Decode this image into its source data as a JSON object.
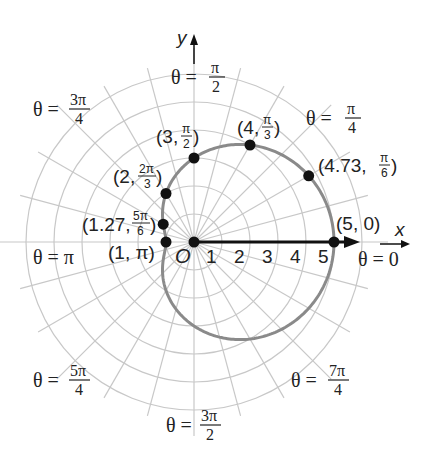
{
  "chart_data": {
    "type": "line",
    "title": "",
    "plot_kind": "polar",
    "equation": "r = 3 + 2cos(theta)",
    "pole": {
      "x": 194,
      "y": 242,
      "label": "O"
    },
    "scale_px_per_unit": 28,
    "grid": {
      "on": true,
      "rings": [
        1,
        2,
        3,
        4,
        5,
        6
      ],
      "spoke_step_deg": 15,
      "color": "#c8c8c8"
    },
    "axes": {
      "x_label": "x",
      "y_label": "y",
      "tick_labels": [
        "1",
        "2",
        "3",
        "4",
        "5"
      ]
    },
    "curve": {
      "color": "#8a8a8a",
      "width": 3
    },
    "points": [
      {
        "r": 5,
        "theta_deg": 0,
        "label": "(5, 0)"
      },
      {
        "r": 4.73,
        "theta_deg": 30,
        "label_prefix": "(4.73, ",
        "label_frac_num": "π",
        "label_frac_den": "6"
      },
      {
        "r": 4,
        "theta_deg": 60,
        "label_prefix": "(4, ",
        "label_frac_num": "π",
        "label_frac_den": "3"
      },
      {
        "r": 3,
        "theta_deg": 90,
        "label_prefix": "(3, ",
        "label_frac_num": "π",
        "label_frac_den": "2"
      },
      {
        "r": 2,
        "theta_deg": 120,
        "label_prefix": "(2, ",
        "label_frac_num": "2π",
        "label_frac_den": "3"
      },
      {
        "r": 1.27,
        "theta_deg": 150,
        "label_prefix": "(1.27, ",
        "label_frac_num": "5π",
        "label_frac_den": "6"
      },
      {
        "r": 1,
        "theta_deg": 180,
        "label": "(1, π)"
      }
    ],
    "angle_labels": [
      {
        "text": "θ = 0",
        "theta_deg": 0
      },
      {
        "text_prefix": "θ = ",
        "num": "π",
        "den": "4",
        "theta_deg": 45
      },
      {
        "text_prefix": "θ = ",
        "num": "π",
        "den": "2",
        "theta_deg": 90
      },
      {
        "text_prefix": "θ = ",
        "num": "3π",
        "den": "4",
        "theta_deg": 135
      },
      {
        "text": "θ = π",
        "theta_deg": 180
      },
      {
        "text_prefix": "θ = ",
        "num": "5π",
        "den": "4",
        "theta_deg": 225
      },
      {
        "text_prefix": "θ = ",
        "num": "3π",
        "den": "2",
        "theta_deg": 270
      },
      {
        "text_prefix": "θ = ",
        "num": "7π",
        "den": "4",
        "theta_deg": 315
      }
    ]
  },
  "labels": {
    "x_axis": "x",
    "y_axis": "y",
    "origin": "O",
    "ticks": [
      "1",
      "2",
      "3",
      "4",
      "5"
    ],
    "theta_0": "θ = 0",
    "theta_pi": "θ = π",
    "theta_prefix": "θ = ",
    "frac": {
      "pi_4": {
        "num": "π",
        "den": "4"
      },
      "pi_2": {
        "num": "π",
        "den": "2"
      },
      "3pi_4": {
        "num": "3π",
        "den": "4"
      },
      "5pi_4": {
        "num": "5π",
        "den": "4"
      },
      "3pi_2": {
        "num": "3π",
        "den": "2"
      },
      "7pi_4": {
        "num": "7π",
        "den": "4"
      }
    },
    "points": {
      "p0": "(5, 0)",
      "p30_prefix": "(4.73, ",
      "p30_num": "π",
      "p30_den": "6",
      "p60_prefix": "(4, ",
      "p60_num": "π",
      "p60_den": "3",
      "p90_prefix": "(3, ",
      "p90_num": "π",
      "p90_den": "2",
      "p120_prefix": "(2, ",
      "p120_num": "2π",
      "p120_den": "3",
      "p150_prefix": "(1.27, ",
      "p150_num": "5π",
      "p150_den": "6",
      "p180": "(1, π)",
      "close": ")"
    }
  }
}
